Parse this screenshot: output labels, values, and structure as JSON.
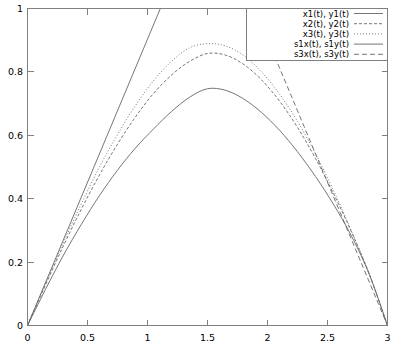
{
  "chart_data": {
    "type": "line",
    "title": "",
    "xlabel": "",
    "ylabel": "",
    "xlim": [
      0,
      3
    ],
    "ylim": [
      0,
      1
    ],
    "grid": false,
    "legend_position": "top-right",
    "xticks": [
      "0",
      "0.5",
      "1",
      "1.5",
      "2",
      "2.5",
      "3"
    ],
    "xtick_values": [
      0,
      0.5,
      1,
      1.5,
      2,
      2.5,
      3
    ],
    "yticks": [
      "0",
      "0.2",
      "0.4",
      "0.6",
      "0.8",
      "1"
    ],
    "ytick_values": [
      0,
      0.2,
      0.4,
      0.6,
      0.8,
      1
    ],
    "series": [
      {
        "name": "x1(t), y1(t)",
        "style": "solid",
        "peak_x": 1.5,
        "peak_y": 0.75,
        "x": [
          0,
          0.15,
          0.3,
          0.45,
          0.6,
          0.75,
          0.9,
          1.05,
          1.2,
          1.35,
          1.5,
          1.65,
          1.8,
          1.95,
          2.1,
          2.25,
          2.4,
          2.55,
          2.7,
          2.85,
          3
        ],
        "y": [
          0,
          0.114,
          0.222,
          0.32,
          0.41,
          0.49,
          0.56,
          0.62,
          0.675,
          0.72,
          0.747,
          0.742,
          0.715,
          0.672,
          0.616,
          0.548,
          0.47,
          0.382,
          0.282,
          0.16,
          0
        ]
      },
      {
        "name": "x2(t), y2(t)",
        "style": "dashed",
        "peak_x": 1.45,
        "peak_y": 0.86,
        "x": [
          0,
          0.15,
          0.3,
          0.45,
          0.6,
          0.75,
          0.9,
          1.05,
          1.2,
          1.35,
          1.5,
          1.65,
          1.8,
          1.95,
          2.1,
          2.25,
          2.4,
          2.55,
          2.7,
          2.85,
          3
        ],
        "y": [
          0,
          0.128,
          0.252,
          0.368,
          0.475,
          0.572,
          0.658,
          0.732,
          0.79,
          0.833,
          0.858,
          0.853,
          0.824,
          0.775,
          0.708,
          0.625,
          0.527,
          0.416,
          0.295,
          0.16,
          0
        ]
      },
      {
        "name": "x3(t), y3(t)",
        "style": "dotted",
        "peak_x": 1.42,
        "peak_y": 0.89,
        "x": [
          0,
          0.15,
          0.3,
          0.45,
          0.6,
          0.75,
          0.9,
          1.05,
          1.2,
          1.35,
          1.5,
          1.65,
          1.8,
          1.95,
          2.1,
          2.25,
          2.4,
          2.55,
          2.7,
          2.85,
          3
        ],
        "y": [
          0,
          0.132,
          0.262,
          0.385,
          0.5,
          0.602,
          0.694,
          0.772,
          0.833,
          0.876,
          0.889,
          0.882,
          0.852,
          0.8,
          0.73,
          0.644,
          0.542,
          0.426,
          0.298,
          0.16,
          0
        ]
      },
      {
        "name": "s1x(t), s1y(t)",
        "style": "solid",
        "note": "straight line from origin, exits top of frame",
        "x": [
          0,
          3
        ],
        "y": [
          0,
          2.71
        ]
      },
      {
        "name": "s3x(t), s3y(t)",
        "style": "dashed-long",
        "note": "straight line descending from top of frame to (3,0)",
        "x": [
          0,
          3
        ],
        "y": [
          2.71,
          0
        ]
      }
    ]
  },
  "legend": {
    "entries": [
      {
        "label": "x1(t), y1(t)",
        "style": "solid"
      },
      {
        "label": "x2(t), y2(t)",
        "style": "dashed"
      },
      {
        "label": "x3(t), y3(t)",
        "style": "dotted"
      },
      {
        "label": "s1x(t), s1y(t)",
        "style": "solid"
      },
      {
        "label": "s3x(t), s3y(t)",
        "style": "dashed-long"
      }
    ]
  },
  "axes": {
    "x_tick_labels": [
      "0",
      "0.5",
      "1",
      "1.5",
      "2",
      "2.5",
      "3"
    ],
    "y_tick_labels": [
      "0",
      "0.2",
      "0.4",
      "0.6",
      "0.8",
      "1"
    ]
  },
  "colors": {
    "frame": "#808080",
    "curve": "#666666",
    "background": "#ffffff",
    "text": "#000000"
  }
}
